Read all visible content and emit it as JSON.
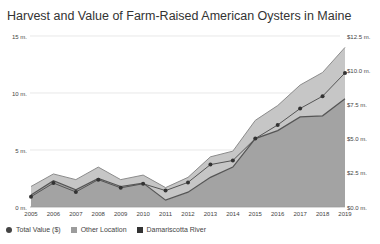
{
  "chart_data": {
    "type": "area",
    "title": "Harvest and Value of Farm-Raised American Oysters in Maine",
    "x": [
      2005,
      2006,
      2007,
      2008,
      2009,
      2010,
      2011,
      2012,
      2013,
      2014,
      2015,
      2016,
      2017,
      2018,
      2019
    ],
    "series": [
      {
        "name": "Damariscotta River",
        "kind": "stacked-area",
        "axis": "left",
        "color": "#9a9a9a",
        "values": [
          1.05,
          2.3,
          1.5,
          2.5,
          1.8,
          2.1,
          0.6,
          1.3,
          2.6,
          3.5,
          6.0,
          6.7,
          7.9,
          8.0,
          9.5
        ]
      },
      {
        "name": "Other Location",
        "kind": "stacked-area",
        "axis": "left",
        "color": "#c4c4c4",
        "values": [
          0.75,
          0.6,
          0.9,
          1.0,
          0.6,
          0.7,
          1.1,
          1.3,
          1.8,
          1.4,
          1.6,
          2.2,
          2.8,
          3.8,
          4.5
        ]
      },
      {
        "name": "Total Value ($)",
        "kind": "line-markers",
        "axis": "right",
        "color": "#4a4a4a",
        "values": [
          0.75,
          1.75,
          1.1,
          2.0,
          1.4,
          1.7,
          1.2,
          1.8,
          3.1,
          3.4,
          5.0,
          6.0,
          7.2,
          8.1,
          9.8
        ]
      }
    ],
    "left_axis": {
      "ticks": [
        "0 m.",
        "5 m.",
        "10 m.",
        "15 m."
      ],
      "values": [
        0,
        5,
        10,
        15
      ],
      "ylim": [
        0,
        15
      ]
    },
    "right_axis": {
      "ticks": [
        "$0.0 m.",
        "$2.5 m.",
        "$5.0 m.",
        "$7.5 m.",
        "$10.0 m.",
        "$12.5 m."
      ],
      "values": [
        0,
        2.5,
        5,
        7.5,
        10,
        12.5
      ],
      "ylim": [
        0,
        12.5
      ]
    },
    "xlabel": "",
    "ylabel": "",
    "grid": true,
    "legend_position": "bottom-left"
  },
  "title": "Harvest and Value of Farm-Raised American Oysters in Maine",
  "legend": [
    {
      "label": "Total Value ($)",
      "shape": "circle",
      "color": "#444444"
    },
    {
      "label": "Other Location",
      "shape": "square",
      "color": "#9c9c9c"
    },
    {
      "label": "Damariscotta River",
      "shape": "square",
      "color": "#333333"
    }
  ]
}
